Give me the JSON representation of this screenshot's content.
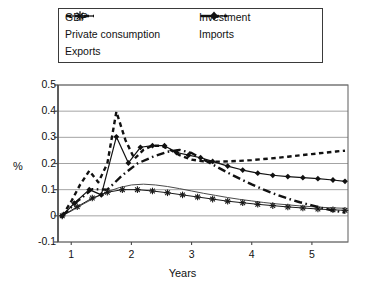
{
  "chart_data": {
    "type": "line",
    "title": "",
    "xlabel": "Years",
    "ylabel": "%",
    "xlim": [
      0.78,
      5.6
    ],
    "ylim": [
      -0.1,
      0.5
    ],
    "xticks": [
      1,
      2,
      3,
      4,
      5
    ],
    "yticks": [
      -0.1,
      0,
      0.1,
      0.2,
      0.3,
      0.4,
      0.5
    ],
    "ytick_labels": [
      "-0.1",
      "0",
      "0.1",
      "0.2",
      "0.3",
      "0.4",
      "0.5"
    ],
    "xtick_labels": [
      "1",
      "2",
      "3",
      "4",
      "5"
    ],
    "grid": "horizontal",
    "legend_position": "top-outside",
    "series": [
      {
        "name": "GDP",
        "style": "solid-thin",
        "marker": "none",
        "color": "#4a4a4a",
        "x": [
          0.85,
          1.0,
          1.2,
          1.4,
          1.6,
          1.8,
          2.0,
          2.2,
          2.4,
          2.6,
          2.8,
          3.0,
          3.2,
          3.4,
          3.6,
          3.8,
          4.0,
          4.2,
          4.4,
          4.6,
          4.8,
          5.0,
          5.2,
          5.4,
          5.55
        ],
        "y": [
          0.0,
          0.018,
          0.045,
          0.07,
          0.092,
          0.108,
          0.118,
          0.121,
          0.118,
          0.112,
          0.104,
          0.095,
          0.086,
          0.078,
          0.07,
          0.063,
          0.057,
          0.051,
          0.046,
          0.042,
          0.038,
          0.035,
          0.032,
          0.03,
          0.029
        ]
      },
      {
        "name": "Private consumption",
        "style": "solid-thin",
        "marker": "asterisk",
        "color": "#1a1a1a",
        "x": [
          0.85,
          1.1,
          1.35,
          1.6,
          1.85,
          2.1,
          2.35,
          2.6,
          2.85,
          3.1,
          3.35,
          3.6,
          3.85,
          4.1,
          4.35,
          4.6,
          4.85,
          5.1,
          5.35,
          5.55
        ],
        "y": [
          0.0,
          0.035,
          0.068,
          0.09,
          0.1,
          0.1,
          0.095,
          0.088,
          0.08,
          0.072,
          0.064,
          0.056,
          0.05,
          0.044,
          0.039,
          0.034,
          0.03,
          0.026,
          0.023,
          0.021
        ]
      },
      {
        "name": "Exports",
        "style": "dashed",
        "marker": "none",
        "color": "#111111",
        "x": [
          0.85,
          1.0,
          1.15,
          1.3,
          1.45,
          1.6,
          1.75,
          1.9,
          2.05,
          2.2,
          2.35,
          2.5,
          2.65,
          2.8,
          3.0,
          3.2,
          3.4,
          3.6,
          3.8,
          4.0,
          4.2,
          4.4,
          4.6,
          4.8,
          5.0,
          5.2,
          5.4,
          5.55
        ],
        "y": [
          0.0,
          0.055,
          0.12,
          0.172,
          0.128,
          0.2,
          0.398,
          0.29,
          0.218,
          0.252,
          0.268,
          0.268,
          0.252,
          0.232,
          0.215,
          0.208,
          0.207,
          0.208,
          0.21,
          0.213,
          0.217,
          0.221,
          0.226,
          0.231,
          0.236,
          0.241,
          0.246,
          0.249
        ]
      },
      {
        "name": "Investment",
        "style": "dash-dot",
        "marker": "none",
        "color": "#111111",
        "x": [
          0.85,
          1.1,
          1.35,
          1.6,
          1.85,
          2.1,
          2.35,
          2.6,
          2.8,
          3.0,
          3.2,
          3.4,
          3.6,
          3.8,
          4.0,
          4.2,
          4.4,
          4.6,
          4.8,
          5.0,
          5.2,
          5.4,
          5.55
        ],
        "y": [
          0.0,
          0.055,
          0.102,
          0.1,
          0.155,
          0.2,
          0.225,
          0.245,
          0.252,
          0.24,
          0.215,
          0.19,
          0.165,
          0.142,
          0.12,
          0.1,
          0.082,
          0.066,
          0.052,
          0.04,
          0.028,
          0.018,
          0.012
        ]
      },
      {
        "name": "Imports",
        "style": "solid",
        "marker": "diamond",
        "color": "#111111",
        "x": [
          0.85,
          1.05,
          1.3,
          1.5,
          1.75,
          1.95,
          2.15,
          2.35,
          2.55,
          2.75,
          2.95,
          3.15,
          3.35,
          3.6,
          3.85,
          4.1,
          4.35,
          4.6,
          4.85,
          5.1,
          5.35,
          5.55
        ],
        "y": [
          0.0,
          0.048,
          0.1,
          0.08,
          0.302,
          0.202,
          0.262,
          0.268,
          0.268,
          0.242,
          0.232,
          0.222,
          0.208,
          0.19,
          0.175,
          0.163,
          0.155,
          0.15,
          0.146,
          0.142,
          0.137,
          0.132
        ]
      }
    ]
  },
  "legend": {
    "left_column": [
      {
        "label": "GDP",
        "icon": "line-solid-thin-swatch"
      },
      {
        "label": "Private consumption",
        "icon": "line-asterisk-swatch"
      },
      {
        "label": "Exports",
        "icon": "line-dashed-swatch"
      }
    ],
    "right_column": [
      {
        "label": "Investment",
        "icon": "line-dashdot-swatch"
      },
      {
        "label": "Imports",
        "icon": "line-diamond-swatch"
      }
    ]
  }
}
